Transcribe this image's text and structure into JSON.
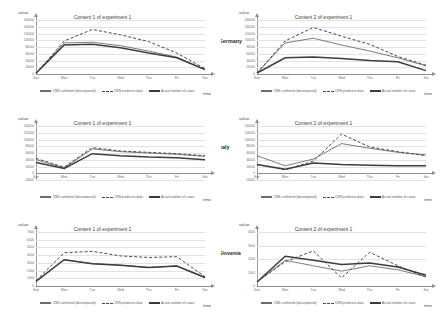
{
  "figure": {
    "axis_y_label": "value",
    "axis_x_label": "time",
    "x_categories": [
      "Sun",
      "Mon",
      "Tue",
      "Wed",
      "Thu",
      "Fri",
      "Sat"
    ],
    "legend": [
      {
        "key": "cnn_decomposed",
        "label": "CNN confirmed (decomposed)",
        "style": "solid-thin"
      },
      {
        "key": "cnn_predicted",
        "label": "CNN predictive data",
        "style": "dashed"
      },
      {
        "key": "actual",
        "label": "Actual number of cases",
        "style": "solid-thick"
      }
    ],
    "colors": {
      "solid_thin": "#6d6d6d",
      "dashed": "#4a4a4a",
      "thick": "#3c3c3c",
      "grid": "#e2e2e2",
      "axis": "#8f8f8f"
    }
  },
  "panels": [
    {
      "id": "germany-content-1",
      "title": "Content 1 of experiment 1",
      "annotation": "",
      "chart_data": {
        "type": "line",
        "title": "Content 1 of experiment 1",
        "xlabel": "time",
        "ylabel": "value",
        "categories": [
          "Sun",
          "Mon",
          "Tue",
          "Wed",
          "Thu",
          "Fri",
          "Sat"
        ],
        "ylim": [
          0,
          160000
        ],
        "yticks": [
          0,
          20000,
          40000,
          60000,
          80000,
          100000,
          120000,
          140000,
          160000
        ],
        "grid": true,
        "legend_position": "bottom",
        "series": [
          {
            "name": "CNN confirmed (decomposed)",
            "values": [
              2000,
              92000,
              94000,
              84000,
              68000,
              50000,
              14000
            ]
          },
          {
            "name": "CNN predictive data",
            "values": [
              2000,
              98000,
              132000,
              116000,
              96000,
              62000,
              16000
            ]
          },
          {
            "name": "Actual number of cases",
            "values": [
              2000,
              86000,
              88000,
              78000,
              62000,
              48000,
              13000
            ]
          }
        ]
      }
    },
    {
      "id": "germany-content-2",
      "title": "Content 2 of experiment 1",
      "annotation": "Prediction results of Germany",
      "chart_data": {
        "type": "line",
        "title": "Content 2 of experiment 1",
        "xlabel": "time",
        "ylabel": "value",
        "categories": [
          "Sun",
          "Mon",
          "Tue",
          "Wed",
          "Thu",
          "Fri",
          "Sat"
        ],
        "ylim": [
          0,
          160000
        ],
        "yticks": [
          0,
          20000,
          40000,
          60000,
          80000,
          100000,
          120000,
          140000,
          160000
        ],
        "grid": true,
        "legend_position": "bottom",
        "series": [
          {
            "name": "CNN confirmed (decomposed)",
            "values": [
              3000,
              92000,
              106000,
              86000,
              68000,
              48000,
              24000
            ]
          },
          {
            "name": "CNN predictive data",
            "values": [
              3000,
              98000,
              138000,
              112000,
              88000,
              52000,
              26000
            ]
          },
          {
            "name": "Actual number of cases",
            "values": [
              3000,
              48000,
              50000,
              46000,
              40000,
              36000,
              10000
            ]
          }
        ]
      }
    },
    {
      "id": "italy-content-1",
      "title": "Content 1 of experiment 1",
      "annotation": "",
      "chart_data": {
        "type": "line",
        "title": "Content 1 of experiment 1",
        "xlabel": "time",
        "ylabel": "value",
        "categories": [
          "Sun",
          "Mon",
          "Tue",
          "Wed",
          "Thu",
          "Fri",
          "Sat"
        ],
        "ylim": [
          -20000,
          140000
        ],
        "yticks": [
          -20000,
          0,
          20000,
          40000,
          60000,
          80000,
          100000,
          120000,
          140000
        ],
        "grid": true,
        "legend_position": "bottom",
        "series": [
          {
            "name": "CNN confirmed (decomposed)",
            "values": [
              40000,
              16000,
              72000,
              64000,
              60000,
              56000,
              50000
            ]
          },
          {
            "name": "CNN predictive data",
            "values": [
              44000,
              18000,
              76000,
              66000,
              62000,
              58000,
              52000
            ]
          },
          {
            "name": "Actual number of cases",
            "values": [
              32000,
              14000,
              58000,
              52000,
              48000,
              46000,
              40000
            ]
          }
        ]
      }
    },
    {
      "id": "italy-content-2",
      "title": "Content 2 of experiment 1",
      "annotation": "Prediction results of Italy",
      "chart_data": {
        "type": "line",
        "title": "Content 2 of experiment 1",
        "xlabel": "time",
        "ylabel": "value",
        "categories": [
          "Sun",
          "Mon",
          "Tue",
          "Wed",
          "Thu",
          "Fri",
          "Sat"
        ],
        "ylim": [
          -20000,
          140000
        ],
        "yticks": [
          -20000,
          0,
          20000,
          40000,
          60000,
          80000,
          100000,
          120000,
          140000
        ],
        "grid": true,
        "legend_position": "bottom",
        "series": [
          {
            "name": "CNN confirmed (decomposed)",
            "values": [
              52000,
              22000,
              42000,
              88000,
              74000,
              62000,
              54000
            ]
          },
          {
            "name": "CNN predictive data",
            "values": [
              26000,
              10000,
              36000,
              116000,
              78000,
              64000,
              52000
            ]
          },
          {
            "name": "Actual number of cases",
            "values": [
              26000,
              12000,
              30000,
              26000,
              24000,
              22000,
              22000
            ]
          }
        ]
      }
    },
    {
      "id": "slovenia-content-1",
      "title": "Content 1 of experiment 1",
      "annotation": "",
      "chart_data": {
        "type": "line",
        "title": "Content 1 of experiment 1",
        "xlabel": "time",
        "ylabel": "value",
        "categories": [
          "Sun",
          "Mon",
          "Tue",
          "Wed",
          "Thu",
          "Fri",
          "Sat"
        ],
        "ylim": [
          0,
          7000
        ],
        "yticks": [
          0,
          1000,
          2000,
          3000,
          4000,
          5000,
          6000,
          7000
        ],
        "grid": true,
        "legend_position": "bottom",
        "series": [
          {
            "name": "CNN confirmed (decomposed)",
            "values": [
              600,
              3400,
              2900,
              2700,
              2400,
              2600,
              1100
            ]
          },
          {
            "name": "CNN predictive data",
            "values": [
              700,
              4300,
              4500,
              3900,
              3700,
              3800,
              1200
            ]
          },
          {
            "name": "Actual number of cases",
            "values": [
              600,
              3400,
              2900,
              2700,
              2400,
              2600,
              1100
            ]
          }
        ]
      }
    },
    {
      "id": "slovenia-content-2",
      "title": "Content 2 of experiment 1",
      "annotation": "Prediction results of Slovenia",
      "chart_data": {
        "type": "line",
        "title": "Content 2 of experiment 1",
        "xlabel": "time",
        "ylabel": "value",
        "categories": [
          "Sun",
          "Mon",
          "Tue",
          "Wed",
          "Thu",
          "Fri",
          "Sat"
        ],
        "ylim": [
          0,
          4000
        ],
        "yticks": [
          0,
          1000,
          2000,
          3000,
          4000
        ],
        "grid": true,
        "legend_position": "bottom",
        "series": [
          {
            "name": "CNN confirmed (decomposed)",
            "values": [
              300,
              1900,
              1500,
              1100,
              1500,
              1200,
              700
            ]
          },
          {
            "name": "CNN predictive data",
            "values": [
              300,
              1800,
              2600,
              600,
              2500,
              1500,
              650
            ]
          },
          {
            "name": "Actual number of cases",
            "values": [
              300,
              2200,
              1900,
              1600,
              1700,
              1400,
              800
            ]
          }
        ]
      }
    }
  ]
}
